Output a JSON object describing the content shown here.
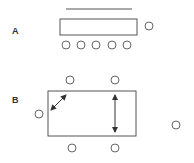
{
  "diagram": {
    "panels": [
      {
        "label": "A",
        "label_pos": [
          12,
          34
        ],
        "top_line": {
          "x1": 66,
          "y1": 9,
          "x2": 132,
          "y2": 9
        },
        "rect": {
          "x": 60,
          "y": 19,
          "w": 77,
          "h": 16
        },
        "circles": [
          {
            "cx": 149,
            "cy": 26,
            "r": 4
          },
          {
            "cx": 66,
            "cy": 45,
            "r": 4
          },
          {
            "cx": 81,
            "cy": 45,
            "r": 4
          },
          {
            "cx": 96,
            "cy": 45,
            "r": 4
          },
          {
            "cx": 112,
            "cy": 45,
            "r": 4
          },
          {
            "cx": 127,
            "cy": 45,
            "r": 4
          }
        ]
      },
      {
        "label": "B",
        "label_pos": [
          12,
          103
        ],
        "rect": {
          "x": 48,
          "y": 91,
          "w": 88,
          "h": 45
        },
        "circles": [
          {
            "cx": 70,
            "cy": 80,
            "r": 4
          },
          {
            "cx": 115,
            "cy": 80,
            "r": 4
          },
          {
            "cx": 39,
            "cy": 114,
            "r": 4
          },
          {
            "cx": 176,
            "cy": 125,
            "r": 4
          },
          {
            "cx": 72,
            "cy": 148,
            "r": 4
          },
          {
            "cx": 115,
            "cy": 148,
            "r": 4
          }
        ],
        "arrows": [
          {
            "name": "diagonal-double-arrow",
            "x1": 51,
            "y1": 110,
            "x2": 66,
            "y2": 95
          },
          {
            "name": "vertical-double-arrow",
            "x1": 115,
            "y1": 95,
            "x2": 115,
            "y2": 132
          }
        ]
      }
    ],
    "colors": {
      "stroke": "#555555",
      "circle": "#666666",
      "label": "#333333"
    }
  }
}
